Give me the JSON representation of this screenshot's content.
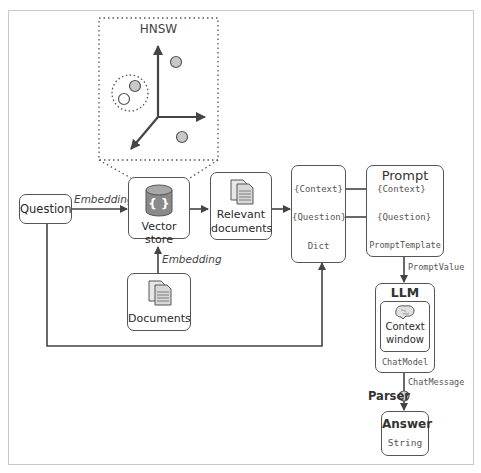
{
  "diagram": {
    "hnsw": {
      "title": "HNSW"
    },
    "nodes": {
      "question": {
        "label": "Question"
      },
      "vector_store": {
        "label": "Vector store"
      },
      "relevant_documents": {
        "line1": "Relevant",
        "line2": "documents"
      },
      "documents": {
        "label": "Documents"
      },
      "dict": {
        "context": "{Context}",
        "question": "{Question}",
        "type": "Dict"
      },
      "prompt": {
        "title": "Prompt",
        "context": "{Context}",
        "question": "{Question}",
        "type": "PromptTemplate"
      },
      "llm": {
        "title": "LLM",
        "inner_line1": "Context",
        "inner_line2": "window",
        "type": "ChatModel"
      },
      "answer": {
        "title": "Answer",
        "type": "String"
      }
    },
    "edges": {
      "question_to_vector": "Embedding",
      "documents_to_vector": "Embedding",
      "prompt_to_llm": "PromptValue",
      "llm_to_answer": "ChatMessage",
      "parser": "Parser"
    },
    "colors": {
      "stroke": "#555555",
      "cylinder": "#8a8a8a",
      "dot_fill": "#c8c8c8",
      "frame": "#c8c8c8"
    }
  }
}
